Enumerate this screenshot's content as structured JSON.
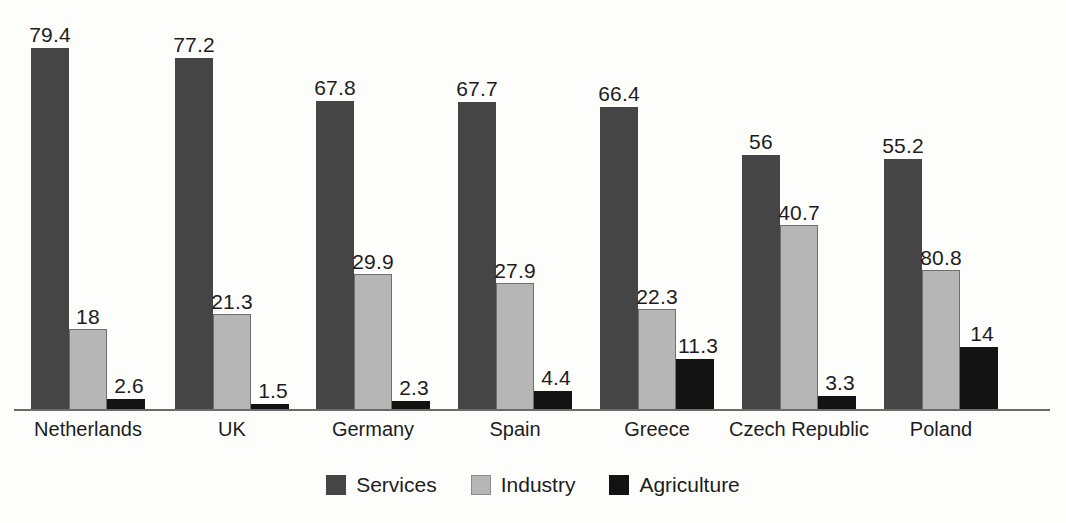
{
  "chart_data": {
    "type": "bar",
    "title": "",
    "subtitle": "",
    "xlabel": "",
    "ylabel": "",
    "grid": false,
    "legend_position": "bottom-center",
    "axis_visible": "x-only",
    "ylim": [
      0,
      79.4
    ],
    "categories": [
      "Netherlands",
      "UK",
      "Germany",
      "Spain",
      "Greece",
      "Czech Republic",
      "Poland"
    ],
    "series": [
      {
        "name": "Services",
        "color": "#454545",
        "values": [
          79.4,
          77.2,
          67.8,
          67.7,
          66.4,
          56,
          55.2
        ],
        "labels": [
          "79.4",
          "77.2",
          "67.8",
          "67.7",
          "66.4",
          "56",
          "55.2"
        ]
      },
      {
        "name": "Industry",
        "color": "#b6b6b6",
        "values": [
          18,
          21.3,
          29.9,
          27.9,
          22.3,
          40.7,
          30.8
        ],
        "labels": [
          "18",
          "21.3",
          "29.9",
          "27.9",
          "22.3",
          "40.7",
          "80.8"
        ]
      },
      {
        "name": "Agriculture",
        "color": "#131313",
        "values": [
          2.6,
          1.5,
          2.3,
          4.4,
          11.3,
          3.3,
          14
        ],
        "labels": [
          "2.6",
          "1.5",
          "2.3",
          "4.4",
          "11.3",
          "3.3",
          "14"
        ]
      }
    ]
  },
  "legend": {
    "items": [
      {
        "label": "Services",
        "swatch": "services-swatch"
      },
      {
        "label": "Industry",
        "swatch": "industry-swatch"
      },
      {
        "label": "Agriculture",
        "swatch": "agriculture-swatch"
      }
    ]
  },
  "colors": {
    "services": "#454545",
    "industry": "#b6b6b6",
    "agriculture": "#131313",
    "axis": "#6a6a6a",
    "text": "#1d1d1d",
    "background": "#fdfdfc"
  }
}
